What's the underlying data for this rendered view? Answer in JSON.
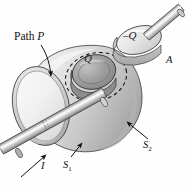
{
  "figure": {
    "domain": "diagram",
    "background_color": "#fefefe",
    "ink_color": "#101010",
    "labels": {
      "path_p_prefix": "Path ",
      "path_p_symbol": "P",
      "charge_q": "Q",
      "charge_negative_q": "–Q",
      "area_a": "A",
      "current_i": "I",
      "surface_1": "S",
      "surface_1_sub": "1",
      "surface_2": "S",
      "surface_2_sub": "2"
    },
    "shapes": {
      "bulb_fill_light": "#efefef",
      "bulb_fill_mid": "#d8d8d8",
      "bulb_fill_dark": "#b4b4b4",
      "disk_fill": "#9a9a9a",
      "rod_fill": "#c9c9c9",
      "outline": "#2c2c2c",
      "dash_color": "#1a1a1a"
    },
    "elements": [
      "dome-surface-s2",
      "flat-face-s1",
      "center-disk-q",
      "dashed-path-p",
      "conducting-rod",
      "detached-plate-negative-q",
      "plate-rod"
    ]
  }
}
